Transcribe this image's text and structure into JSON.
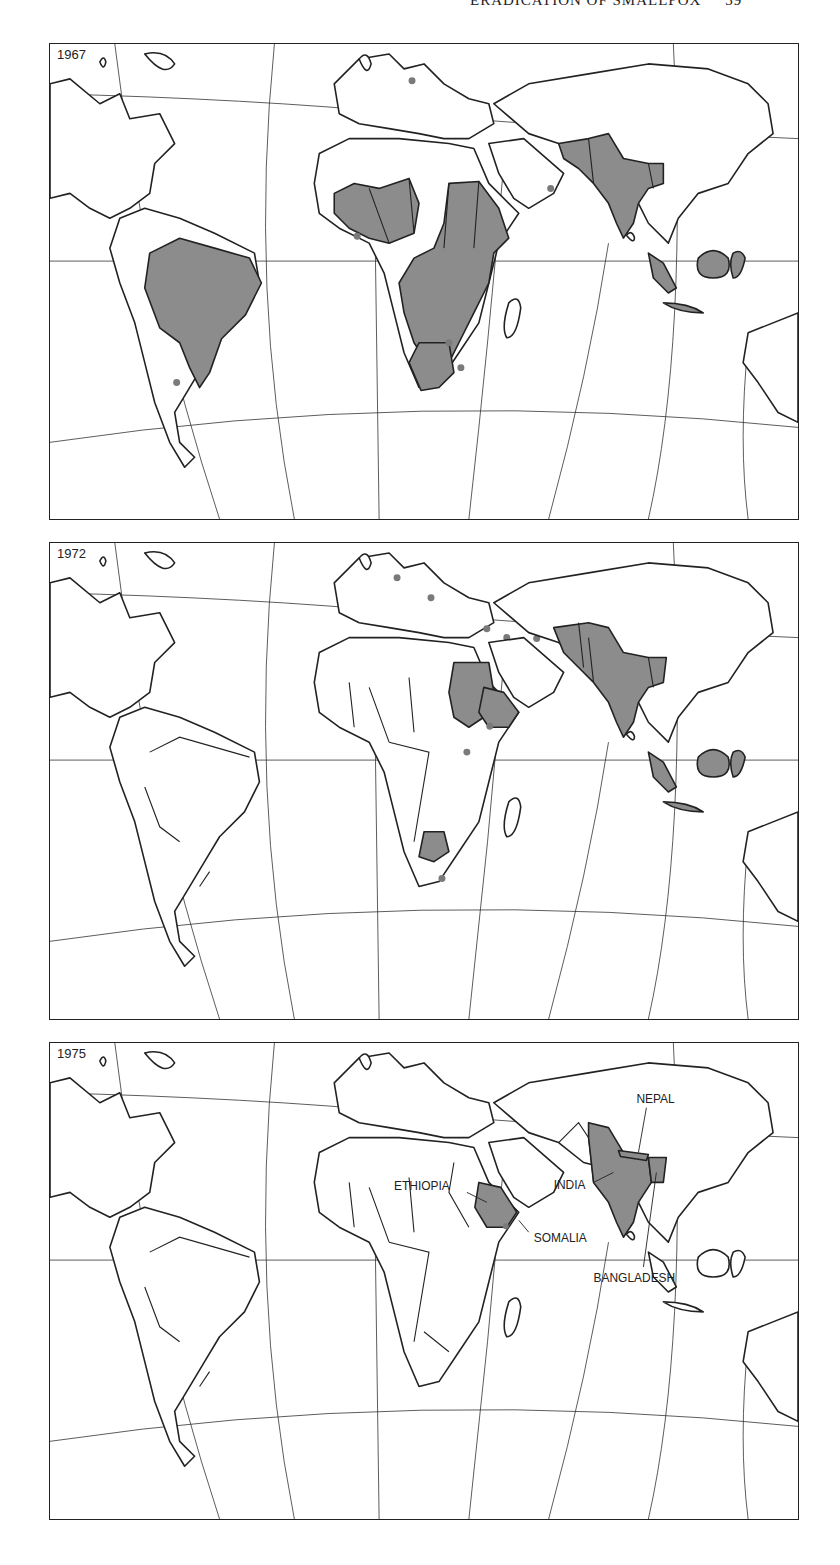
{
  "running_head": {
    "text": "ERADICATION OF SMALLPOX",
    "page_number": "39"
  },
  "colors": {
    "endemic_fill": "#8c8c8c",
    "imported_case_dot": "#7a7a7a",
    "outline": "#222222",
    "background": "#ffffff"
  },
  "legend_semantics": {
    "shaded": "countries with endemic smallpox",
    "dot": "imported cases"
  },
  "maps": [
    {
      "year": "1967",
      "endemic_regions": [
        "Brazil",
        "West Africa",
        "Central Africa",
        "East Africa",
        "Southern Africa",
        "Sudan",
        "Ethiopia",
        "South Asia (India, Pakistan, Afghanistan, Nepal)",
        "Indonesia"
      ],
      "imported_case_dots": 7
    },
    {
      "year": "1972",
      "endemic_regions": [
        "Sudan",
        "Ethiopia",
        "Botswana",
        "South Asia (India, Pakistan, Afghanistan, Nepal, Bangladesh)",
        "Indonesia"
      ],
      "imported_case_dots": 8
    },
    {
      "year": "1975",
      "endemic_regions": [
        "Ethiopia",
        "India",
        "Nepal",
        "Bangladesh"
      ],
      "imported_case_dots": 1,
      "labels": {
        "ethiopia": "ETHIOPIA",
        "somalia": "SOMALIA",
        "india": "INDIA",
        "nepal": "NEPAL",
        "bangladesh": "BANGLADESH"
      }
    }
  ]
}
